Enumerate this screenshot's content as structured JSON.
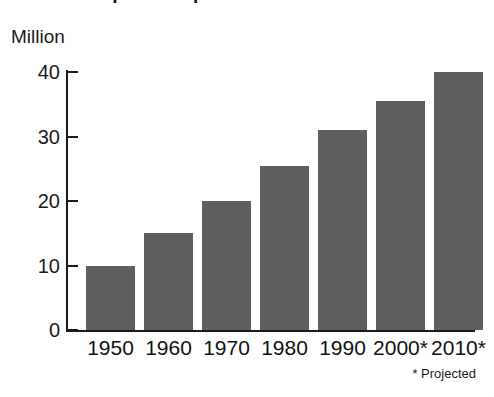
{
  "figure": {
    "title_clipped": "Hispanic Population in the United States",
    "unit_label": "Million",
    "footnote": "* Projected",
    "bar_color": "#5e5e5e",
    "axis_color": "#1a1a1a",
    "background_color": "#ffffff"
  },
  "chart_data": {
    "type": "bar",
    "title": "",
    "xlabel": "",
    "ylabel": "Million",
    "categories": [
      "1950",
      "1960",
      "1970",
      "1980",
      "1990",
      "2000*",
      "2010*"
    ],
    "values": [
      10.0,
      15.0,
      20.0,
      25.5,
      31.0,
      35.5,
      40.0
    ],
    "ylim": [
      0,
      40
    ],
    "yticks": [
      "0",
      "10",
      "20",
      "30",
      "40"
    ],
    "ytick_values": [
      0,
      10,
      20,
      30,
      40
    ],
    "grid": false,
    "legend": "none",
    "annotations": [
      "* Projected"
    ]
  }
}
